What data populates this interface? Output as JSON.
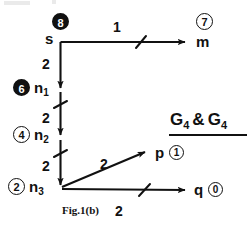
{
  "figure": {
    "caption": "Fig.1(b)",
    "graph_title": {
      "prefix": "G",
      "sub1": "4",
      "amp": "&",
      "prefix2": "G",
      "sub2": "4"
    },
    "ink_color": "#111111",
    "background": "#ffffff"
  },
  "nodes": [
    {
      "id": "s",
      "label": "s",
      "sub": "",
      "tag": "8",
      "tag_style": "filled",
      "x": 60,
      "y": 42
    },
    {
      "id": "m",
      "label": "m",
      "sub": "",
      "tag": "7",
      "tag_style": "open",
      "x": 196,
      "y": 42
    },
    {
      "id": "n1",
      "label": "n",
      "sub": "1",
      "tag": "6",
      "tag_style": "filled",
      "x": 60,
      "y": 90
    },
    {
      "id": "n2",
      "label": "n",
      "sub": "2",
      "tag": "4",
      "tag_style": "open",
      "x": 60,
      "y": 137
    },
    {
      "id": "n3",
      "label": "n",
      "sub": "3",
      "tag": "2",
      "tag_style": "open",
      "x": 60,
      "y": 188
    },
    {
      "id": "p",
      "label": "p",
      "sub": "",
      "tag": "1",
      "tag_style": "open",
      "x": 155,
      "y": 156
    },
    {
      "id": "q",
      "label": "q",
      "sub": "",
      "tag": "0",
      "tag_style": "ring",
      "x": 196,
      "y": 190
    }
  ],
  "edges": [
    {
      "from": "s",
      "to": "m",
      "weight": "1",
      "ticked": true
    },
    {
      "from": "s",
      "to": "n1",
      "weight": "2",
      "ticked": false
    },
    {
      "from": "n1",
      "to": "n2",
      "weight": "2",
      "ticked": true
    },
    {
      "from": "n2",
      "to": "n3",
      "weight": "2",
      "ticked": true
    },
    {
      "from": "n3",
      "to": "p",
      "weight": "2",
      "ticked": false
    },
    {
      "from": "n3",
      "to": "q",
      "weight": "2",
      "ticked": true
    }
  ],
  "labels": {
    "node_s": "s",
    "node_m": "m",
    "node_n1_base": "n",
    "node_n1_sub": "1",
    "node_n2_base": "n",
    "node_n2_sub": "2",
    "node_n3_base": "n",
    "node_n3_sub": "3",
    "node_p": "p",
    "node_q": "q",
    "tag_s": "8",
    "tag_m": "7",
    "tag_n1": "6",
    "tag_n2": "4",
    "tag_n3": "2",
    "tag_p": "1",
    "tag_q": "0",
    "w_s_m": "1",
    "w_s_n1": "2",
    "w_n1_n2": "2",
    "w_n2_n3": "2",
    "w_n3_p": "2",
    "w_n3_q": "2"
  }
}
